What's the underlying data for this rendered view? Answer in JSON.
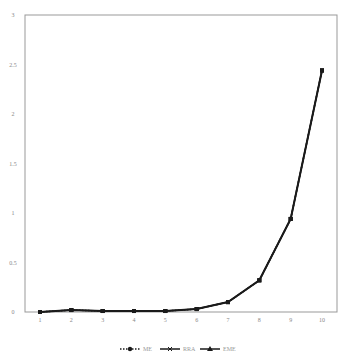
{
  "caption": "",
  "chart_data": {
    "type": "line",
    "title": "",
    "xlabel": "",
    "ylabel": "",
    "x": [
      1,
      2,
      3,
      4,
      5,
      6,
      7,
      8,
      9,
      10
    ],
    "series": [
      {
        "name": "ME",
        "style": "dotted",
        "marker": "circle",
        "values": [
          0,
          0.02,
          0.01,
          0.01,
          0.01,
          0.03,
          0.1,
          0.32,
          0.94,
          2.44
        ]
      },
      {
        "name": "RRA",
        "style": "solid",
        "marker": "x",
        "values": [
          0,
          0.02,
          0.01,
          0.01,
          0.01,
          0.03,
          0.1,
          0.32,
          0.94,
          2.44
        ]
      },
      {
        "name": "EME",
        "style": "solid",
        "marker": "triangle",
        "values": [
          0,
          0.02,
          0.01,
          0.01,
          0.01,
          0.03,
          0.1,
          0.32,
          0.94,
          2.44
        ]
      }
    ],
    "ylim": [
      0,
      3
    ],
    "yticks": [
      0,
      0.5,
      1,
      1.5,
      2,
      2.5,
      3
    ],
    "ytick_labels": [
      "0",
      "0.5",
      "1",
      "1.5",
      "2",
      "2.5",
      "3"
    ],
    "xtick_labels": [
      "1",
      "2",
      "3",
      "4",
      "5",
      "6",
      "7",
      "8",
      "9",
      "10"
    ],
    "grid": false,
    "legend_position": "bottom",
    "line_color": "#1a1a1a",
    "axis_color": "#888888"
  }
}
